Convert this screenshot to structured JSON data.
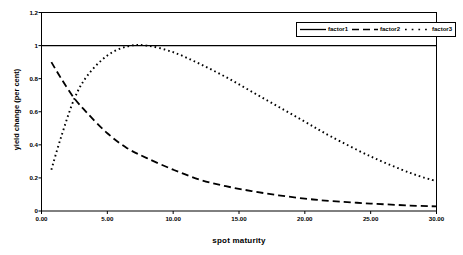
{
  "chart_data": {
    "type": "line",
    "title": "",
    "xlabel": "spot maturity",
    "ylabel": "yield change (per cent)",
    "xlim": [
      0,
      30
    ],
    "ylim": [
      0,
      1.2
    ],
    "xticks": [
      "0.00",
      "5.00",
      "10.00",
      "15.00",
      "20.00",
      "25.00",
      "30.00"
    ],
    "xtick_values": [
      0,
      5,
      10,
      15,
      20,
      25,
      30
    ],
    "yticks": [
      "0",
      "0.2",
      "0.4",
      "0.6",
      "0.8",
      "1",
      "1.2"
    ],
    "ytick_values": [
      0,
      0.2,
      0.4,
      0.6,
      0.8,
      1,
      1.2
    ],
    "grid": false,
    "legend_position": "top-right",
    "x": [
      0.75,
      1.5,
      2.5,
      3.5,
      5,
      6.5,
      8,
      10,
      12,
      14,
      16,
      18,
      20,
      22,
      25,
      28,
      30
    ],
    "series": [
      {
        "name": "factor1",
        "style": "solid",
        "values": [
          1.0,
          1.0,
          1.0,
          1.0,
          1.0,
          1.0,
          1.0,
          1.0,
          1.0,
          1.0,
          1.0,
          1.0,
          1.0,
          1.0,
          1.0,
          1.0,
          1.0
        ]
      },
      {
        "name": "factor2",
        "style": "dashed",
        "values": [
          0.9,
          0.8,
          0.68,
          0.59,
          0.47,
          0.38,
          0.32,
          0.25,
          0.19,
          0.15,
          0.12,
          0.095,
          0.075,
          0.06,
          0.045,
          0.033,
          0.028
        ]
      },
      {
        "name": "factor3",
        "style": "dotted",
        "values": [
          0.25,
          0.45,
          0.68,
          0.82,
          0.94,
          0.995,
          1.0,
          0.96,
          0.89,
          0.81,
          0.72,
          0.63,
          0.54,
          0.45,
          0.33,
          0.23,
          0.18
        ]
      }
    ],
    "colors": {
      "axis": "#000000",
      "factor1": "#000000",
      "factor2": "#000000",
      "factor3": "#000000",
      "background": "#ffffff"
    }
  },
  "legend": {
    "entries": [
      {
        "label": "factor1"
      },
      {
        "label": "factor2"
      },
      {
        "label": "factor3"
      }
    ]
  }
}
